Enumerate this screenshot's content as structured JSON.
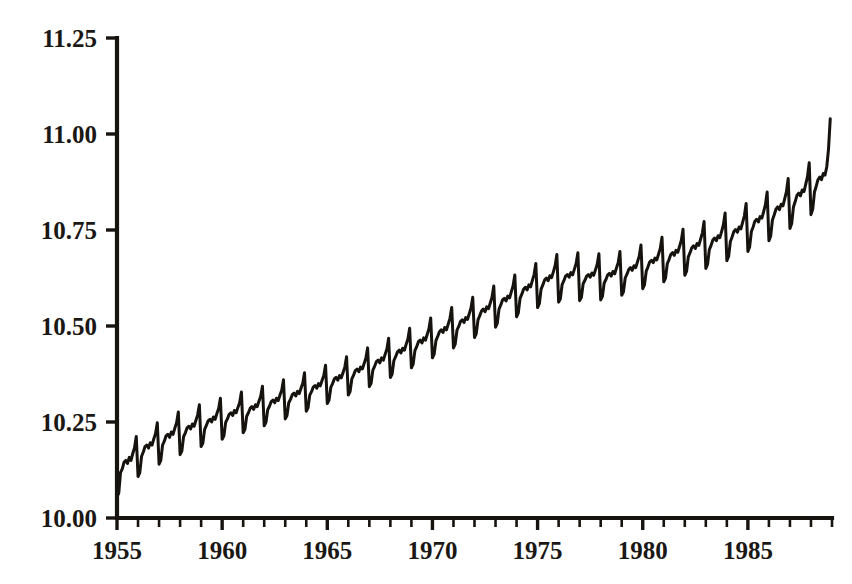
{
  "figure": {
    "background_color": "#ffffff",
    "ink_color": "#17130f"
  },
  "chart_data": {
    "type": "line",
    "title": "",
    "subtitle": "",
    "xlabel": "",
    "ylabel": "",
    "xlim": [
      1954.9,
      1989.0
    ],
    "ylim": [
      10.0,
      11.25
    ],
    "grid": false,
    "legend": null,
    "annotations": [],
    "y_ticks": [
      10.0,
      10.25,
      10.5,
      10.75,
      11.0,
      11.25
    ],
    "y_tick_labels": [
      "10.00",
      "10.25",
      "10.50",
      "10.75",
      "11.00",
      "11.25"
    ],
    "x_ticks": [
      1955,
      1960,
      1965,
      1970,
      1975,
      1980,
      1985
    ],
    "x_tick_labels": [
      "1955",
      "1960",
      "1965",
      "1970",
      "1975",
      "1980",
      "1985"
    ],
    "x_minor_tick_step": 1,
    "x_minor_tick_range": [
      1955,
      1989
    ],
    "series": [
      {
        "name": "series-1",
        "color": "#16120e",
        "x_start": 1955.0,
        "x_step": 0.0833333,
        "description": "Monthly log-scale series, 1955-01 through 1988-12, strong annual seasonality with sharp December peak and January trough, rising trend with plateau 1974-1976.",
        "values": [
          10.055,
          10.065,
          10.118,
          10.128,
          10.145,
          10.15,
          10.142,
          10.158,
          10.15,
          10.168,
          10.183,
          10.212,
          10.108,
          10.118,
          10.16,
          10.172,
          10.186,
          10.19,
          10.182,
          10.196,
          10.19,
          10.206,
          10.22,
          10.248,
          10.14,
          10.15,
          10.19,
          10.2,
          10.214,
          10.218,
          10.21,
          10.224,
          10.218,
          10.234,
          10.248,
          10.276,
          10.165,
          10.174,
          10.212,
          10.222,
          10.235,
          10.239,
          10.232,
          10.245,
          10.239,
          10.254,
          10.268,
          10.295,
          10.186,
          10.195,
          10.231,
          10.241,
          10.253,
          10.257,
          10.25,
          10.263,
          10.257,
          10.272,
          10.285,
          10.312,
          10.205,
          10.214,
          10.249,
          10.258,
          10.27,
          10.274,
          10.267,
          10.28,
          10.274,
          10.288,
          10.301,
          10.328,
          10.222,
          10.231,
          10.265,
          10.274,
          10.286,
          10.29,
          10.283,
          10.295,
          10.29,
          10.304,
          10.317,
          10.343,
          10.24,
          10.249,
          10.282,
          10.291,
          10.303,
          10.307,
          10.3,
          10.312,
          10.306,
          10.32,
          10.333,
          10.36,
          10.258,
          10.267,
          10.3,
          10.309,
          10.321,
          10.325,
          10.318,
          10.33,
          10.324,
          10.338,
          10.351,
          10.378,
          10.278,
          10.287,
          10.32,
          10.329,
          10.341,
          10.345,
          10.338,
          10.35,
          10.344,
          10.358,
          10.371,
          10.398,
          10.298,
          10.307,
          10.34,
          10.35,
          10.362,
          10.366,
          10.359,
          10.371,
          10.365,
          10.379,
          10.393,
          10.42,
          10.32,
          10.329,
          10.362,
          10.372,
          10.384,
          10.388,
          10.381,
          10.393,
          10.388,
          10.402,
          10.416,
          10.443,
          10.342,
          10.351,
          10.385,
          10.395,
          10.407,
          10.411,
          10.404,
          10.417,
          10.411,
          10.426,
          10.44,
          10.468,
          10.366,
          10.375,
          10.41,
          10.42,
          10.432,
          10.437,
          10.43,
          10.442,
          10.437,
          10.452,
          10.466,
          10.494,
          10.391,
          10.401,
          10.436,
          10.446,
          10.459,
          10.463,
          10.456,
          10.469,
          10.463,
          10.478,
          10.493,
          10.521,
          10.417,
          10.427,
          10.462,
          10.473,
          10.485,
          10.49,
          10.483,
          10.496,
          10.49,
          10.505,
          10.52,
          10.548,
          10.443,
          10.453,
          10.489,
          10.499,
          10.512,
          10.516,
          10.509,
          10.522,
          10.517,
          10.532,
          10.547,
          10.575,
          10.47,
          10.48,
          10.516,
          10.527,
          10.539,
          10.544,
          10.537,
          10.55,
          10.545,
          10.56,
          10.575,
          10.604,
          10.497,
          10.507,
          10.544,
          10.555,
          10.568,
          10.572,
          10.565,
          10.578,
          10.573,
          10.589,
          10.604,
          10.633,
          10.524,
          10.534,
          10.572,
          10.583,
          10.596,
          10.601,
          10.594,
          10.607,
          10.602,
          10.618,
          10.634,
          10.663,
          10.548,
          10.558,
          10.596,
          10.607,
          10.62,
          10.625,
          10.618,
          10.631,
          10.626,
          10.641,
          10.657,
          10.686,
          10.562,
          10.571,
          10.608,
          10.618,
          10.63,
          10.634,
          10.627,
          10.639,
          10.633,
          10.648,
          10.663,
          10.691,
          10.566,
          10.575,
          10.61,
          10.619,
          10.63,
          10.634,
          10.627,
          10.638,
          10.632,
          10.646,
          10.66,
          10.688,
          10.568,
          10.577,
          10.612,
          10.621,
          10.633,
          10.637,
          10.63,
          10.642,
          10.636,
          10.651,
          10.665,
          10.694,
          10.58,
          10.589,
          10.625,
          10.635,
          10.647,
          10.652,
          10.645,
          10.657,
          10.652,
          10.667,
          10.682,
          10.711,
          10.597,
          10.607,
          10.643,
          10.654,
          10.667,
          10.671,
          10.665,
          10.677,
          10.672,
          10.687,
          10.702,
          10.731,
          10.615,
          10.625,
          10.662,
          10.673,
          10.686,
          10.691,
          10.684,
          10.697,
          10.692,
          10.707,
          10.723,
          10.752,
          10.632,
          10.642,
          10.68,
          10.691,
          10.704,
          10.709,
          10.702,
          10.715,
          10.71,
          10.726,
          10.742,
          10.772,
          10.65,
          10.661,
          10.699,
          10.71,
          10.724,
          10.729,
          10.722,
          10.735,
          10.73,
          10.746,
          10.763,
          10.794,
          10.67,
          10.681,
          10.72,
          10.732,
          10.746,
          10.751,
          10.744,
          10.758,
          10.753,
          10.77,
          10.787,
          10.819,
          10.694,
          10.706,
          10.746,
          10.758,
          10.773,
          10.778,
          10.771,
          10.785,
          10.781,
          10.798,
          10.816,
          10.849,
          10.722,
          10.734,
          10.776,
          10.789,
          10.804,
          10.81,
          10.803,
          10.817,
          10.813,
          10.831,
          10.85,
          10.884,
          10.754,
          10.767,
          10.81,
          10.824,
          10.84,
          10.846,
          10.839,
          10.854,
          10.85,
          10.869,
          10.889,
          10.925,
          10.79,
          10.804,
          10.849,
          10.864,
          10.881,
          10.888,
          10.881,
          10.897,
          10.893,
          10.914,
          10.96,
          11.04
        ]
      }
    ]
  }
}
